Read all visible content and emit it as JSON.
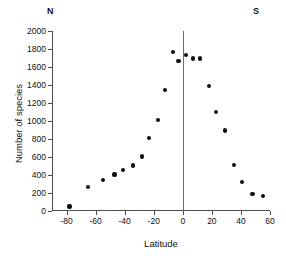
{
  "figure": {
    "hemisphere_left_label": "N",
    "hemisphere_right_label": "S"
  },
  "chart_data": {
    "type": "scatter",
    "title": "",
    "subtitle": "",
    "xlabel": "Latitude",
    "ylabel": "Number of species",
    "xlim": [
      -90,
      60
    ],
    "ylim": [
      0,
      2000
    ],
    "xticks": [
      -80,
      -60,
      -40,
      -20,
      0,
      20,
      40,
      60
    ],
    "xtick_labels": [
      "-80",
      "-60",
      "-40",
      "-20",
      "0",
      "20",
      "40",
      "60"
    ],
    "yticks": [
      0,
      200,
      400,
      600,
      800,
      1000,
      1200,
      1400,
      1600,
      1800,
      2000
    ],
    "ytick_labels": [
      "0",
      "200",
      "400",
      "600",
      "800",
      "1000",
      "1200",
      "1400",
      "1600",
      "1800",
      "2000"
    ],
    "grid": false,
    "legend": null,
    "annotations": [
      {
        "name": "north-hemisphere-marker",
        "text": "N",
        "position": "top-left"
      },
      {
        "name": "south-hemisphere-marker",
        "text": "S",
        "position": "top-right"
      }
    ],
    "reference_lines": [
      {
        "name": "equator-line",
        "axis": "x",
        "value": 0,
        "color": "#6d6d6d"
      }
    ],
    "marker": {
      "shape": "circle",
      "color": "#101010",
      "size": 4
    },
    "series": [
      {
        "name": "species richness",
        "x": [
          -78,
          -65,
          -55,
          -47,
          -41,
          -34,
          -28,
          -23,
          -17,
          -12,
          -7,
          -3,
          2,
          7,
          12,
          18,
          23,
          29,
          35,
          41,
          48,
          55
        ],
        "y": [
          50,
          270,
          340,
          405,
          455,
          505,
          605,
          810,
          1015,
          1345,
          1770,
          1665,
          1730,
          1695,
          1695,
          1385,
          1100,
          895,
          510,
          325,
          190,
          165
        ]
      }
    ]
  }
}
